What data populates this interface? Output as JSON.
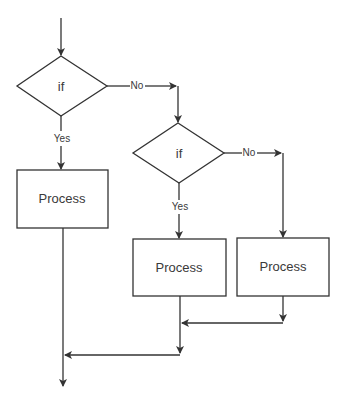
{
  "diagram": {
    "type": "flowchart",
    "colors": {
      "stroke": "#333333",
      "text": "#3a3a3a",
      "background": "#ffffff"
    },
    "nodes": [
      {
        "id": "decision1",
        "shape": "diamond",
        "label": "if"
      },
      {
        "id": "decision2",
        "shape": "diamond",
        "label": "if"
      },
      {
        "id": "process1",
        "shape": "rectangle",
        "label": "Process"
      },
      {
        "id": "process2",
        "shape": "rectangle",
        "label": "Process"
      },
      {
        "id": "process3",
        "shape": "rectangle",
        "label": "Process"
      }
    ],
    "edges": [
      {
        "from": "start",
        "to": "decision1",
        "label": ""
      },
      {
        "from": "decision1",
        "to": "process1",
        "label": "Yes"
      },
      {
        "from": "decision1",
        "to": "decision2",
        "label": "No"
      },
      {
        "from": "decision2",
        "to": "process2",
        "label": "Yes"
      },
      {
        "from": "decision2",
        "to": "process3",
        "label": "No"
      },
      {
        "from": "process3",
        "to": "process2-merge",
        "label": ""
      },
      {
        "from": "process2-merge",
        "to": "process1-merge",
        "label": ""
      },
      {
        "from": "process1-merge",
        "to": "end",
        "label": ""
      }
    ]
  }
}
